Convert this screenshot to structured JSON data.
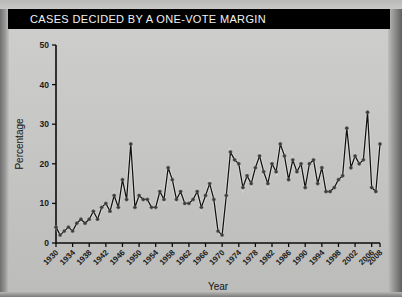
{
  "title": "CASES DECIDED BY A ONE-VOTE MARGIN",
  "axis": {
    "y_title": "Percentage",
    "x_title": "Year"
  },
  "colors": {
    "title_bar": "#000000",
    "title_text": "#f2f2f2",
    "line": "#111111",
    "marker": "#3a3a3a",
    "background": "#c6c6c4"
  },
  "chart_data": {
    "type": "line",
    "title": "CASES DECIDED BY A ONE-VOTE MARGIN",
    "xlabel": "Year",
    "ylabel": "Percentage",
    "ylim": [
      0,
      50
    ],
    "yticks": [
      0,
      10,
      20,
      30,
      40,
      50
    ],
    "xlim": [
      1930,
      2008
    ],
    "xticks": [
      1930,
      1934,
      1938,
      1942,
      1946,
      1950,
      1954,
      1958,
      1962,
      1966,
      1970,
      1974,
      1978,
      1982,
      1986,
      1990,
      1994,
      1998,
      2002,
      2006,
      2008
    ],
    "grid": false,
    "legend": "none",
    "markers": true,
    "x": [
      1930,
      1931,
      1932,
      1933,
      1934,
      1935,
      1936,
      1937,
      1938,
      1939,
      1940,
      1941,
      1942,
      1943,
      1944,
      1945,
      1946,
      1947,
      1948,
      1949,
      1950,
      1951,
      1952,
      1953,
      1954,
      1955,
      1956,
      1957,
      1958,
      1959,
      1960,
      1961,
      1962,
      1963,
      1964,
      1965,
      1966,
      1967,
      1968,
      1969,
      1970,
      1971,
      1972,
      1973,
      1974,
      1975,
      1976,
      1977,
      1978,
      1979,
      1980,
      1981,
      1982,
      1983,
      1984,
      1985,
      1986,
      1987,
      1988,
      1989,
      1990,
      1991,
      1992,
      1993,
      1994,
      1995,
      1996,
      1997,
      1998,
      1999,
      2000,
      2001,
      2002,
      2003,
      2004,
      2005,
      2006,
      2007,
      2008
    ],
    "values": [
      4,
      2,
      3,
      4,
      3,
      5,
      6,
      5,
      6,
      8,
      6,
      9,
      10,
      8,
      12,
      9,
      16,
      11,
      25,
      9,
      12,
      11,
      11,
      9,
      9,
      13,
      11,
      19,
      16,
      11,
      13,
      10,
      10,
      11,
      13,
      9,
      12,
      15,
      11,
      3,
      2,
      12,
      23,
      21,
      20,
      14,
      17,
      15,
      19,
      22,
      18,
      15,
      20,
      18,
      25,
      22,
      16,
      21,
      18,
      20,
      14,
      20,
      21,
      15,
      19,
      13,
      13,
      14,
      16,
      17,
      29,
      19,
      22,
      20,
      21,
      33,
      14,
      13,
      25
    ],
    "series": [
      {
        "name": "Cases decided by a one-vote margin",
        "values": [
          4,
          2,
          3,
          4,
          3,
          5,
          6,
          5,
          6,
          8,
          6,
          9,
          10,
          8,
          12,
          9,
          16,
          11,
          25,
          9,
          12,
          11,
          11,
          9,
          9,
          13,
          11,
          19,
          16,
          11,
          13,
          10,
          10,
          11,
          13,
          9,
          12,
          15,
          11,
          3,
          2,
          12,
          23,
          21,
          20,
          14,
          17,
          15,
          19,
          22,
          18,
          15,
          20,
          18,
          25,
          22,
          16,
          21,
          18,
          20,
          14,
          20,
          21,
          15,
          19,
          13,
          13,
          14,
          16,
          17,
          29,
          19,
          22,
          20,
          21,
          33,
          14,
          13,
          25
        ]
      }
    ]
  }
}
